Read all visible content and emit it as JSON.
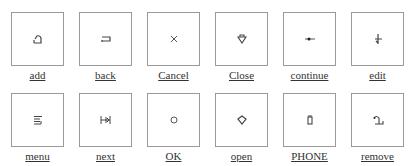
{
  "buttons": [
    {
      "label": "add",
      "icon": "add-icon"
    },
    {
      "label": "back",
      "icon": "back-icon"
    },
    {
      "label": "Cancel",
      "icon": "cancel-icon"
    },
    {
      "label": "Close",
      "icon": "close-icon"
    },
    {
      "label": "continue",
      "icon": "continue-icon"
    },
    {
      "label": "edit",
      "icon": "edit-icon"
    },
    {
      "label": "menu",
      "icon": "menu-icon"
    },
    {
      "label": "next",
      "icon": "next-icon"
    },
    {
      "label": "OK",
      "icon": "ok-icon"
    },
    {
      "label": "open",
      "icon": "open-icon"
    },
    {
      "label": "PHONE",
      "icon": "phone-icon"
    },
    {
      "label": "remove",
      "icon": "remove-icon"
    }
  ],
  "colors": {
    "border": "#9a9a9a",
    "icon": "#444444",
    "label": "#333333"
  }
}
